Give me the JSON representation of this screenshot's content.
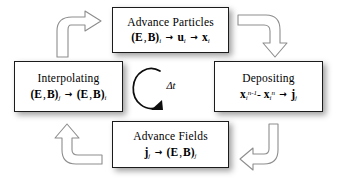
{
  "diagram": {
    "background_color": "#ffffff",
    "box_border_color": "#1b1b1b",
    "arrow_outline_color": "#8d8d8d",
    "text_color": "#000000",
    "center": {
      "label": "Δt",
      "icon": "circular-arrow-counterclockwise-icon"
    },
    "nodes": {
      "top": {
        "title": "Advance Particles",
        "formula_plain": "(E , B)i → ui → xi",
        "terms": {
          "source": "(E , B)",
          "source_sub": "i",
          "mid": "u",
          "mid_sub": "i",
          "target": "x",
          "target_sub": "i",
          "arrow": "→"
        }
      },
      "right": {
        "title": "Depositing",
        "formula_plain": "xi^(n-1) - xi^n → jj",
        "terms": {
          "a_base": "x",
          "a_sub": "i",
          "a_sup": "n-1",
          "minus": "-",
          "b_base": "x",
          "b_sub": "i",
          "b_sup": "n",
          "target": "j",
          "target_sub": "j",
          "arrow": "→"
        }
      },
      "bottom": {
        "title": "Advance Fields",
        "formula_plain": "jj → (E , B)j",
        "terms": {
          "source": "j",
          "source_sub": "j",
          "target": "(E , B)",
          "target_sub": "j",
          "arrow": "→"
        }
      },
      "left": {
        "title": "Interpolating",
        "formula_plain": "(E , B)j → (E , B)i",
        "terms": {
          "source": "(E , B)",
          "source_sub": "j",
          "target": "(E , B)",
          "target_sub": "i",
          "arrow": "→"
        }
      }
    },
    "connectors": {
      "top_left": {
        "icon": "curved-block-arrow-up-right-icon",
        "from": "Interpolating",
        "to": "Advance Particles"
      },
      "top_right": {
        "icon": "curved-block-arrow-right-down-icon",
        "from": "Advance Particles",
        "to": "Depositing"
      },
      "bottom_right": {
        "icon": "curved-block-arrow-down-left-icon",
        "from": "Depositing",
        "to": "Advance Fields"
      },
      "bottom_left": {
        "icon": "curved-block-arrow-left-up-icon",
        "from": "Advance Fields",
        "to": "Interpolating"
      }
    }
  }
}
